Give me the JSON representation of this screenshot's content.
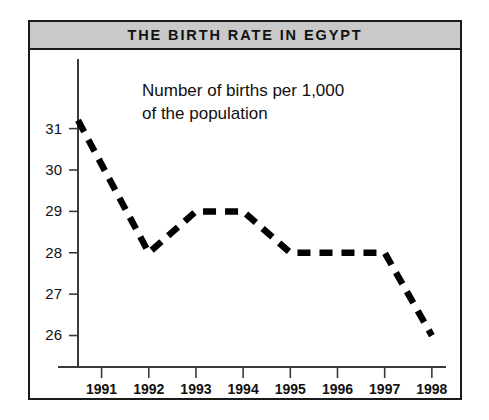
{
  "figure": {
    "title": "THE BIRTH RATE IN EGYPT",
    "annotation": "Number of births per 1,000\nof the population",
    "frame_color": "#1a1a1a",
    "banner_color": "#c9c9c9",
    "line_color": "#000000",
    "background_color": "#ffffff"
  },
  "chart_data": {
    "type": "line",
    "title": "THE BIRTH RATE IN EGYPT",
    "subtitle": "Number of births per 1,000 of the population",
    "xlabel": "",
    "ylabel": "",
    "x": [
      1990.5,
      1992,
      1993,
      1994,
      1995,
      1996,
      1997,
      1998
    ],
    "values": [
      31.2,
      28,
      29,
      29,
      28,
      28,
      28,
      26
    ],
    "categories": [
      "1991",
      "1992",
      "1993",
      "1994",
      "1995",
      "1996",
      "1997",
      "1998"
    ],
    "xtick_labels": [
      "1991",
      "1992",
      "1993",
      "1994",
      "1995",
      "1996",
      "1997",
      "1998"
    ],
    "ytick_labels": [
      "31",
      "30",
      "29",
      "28",
      "27",
      "26"
    ],
    "ytick_values": [
      31,
      30,
      29,
      28,
      27,
      26
    ],
    "xlim": [
      1990.5,
      1998.3
    ],
    "ylim": [
      25.65,
      31.45
    ],
    "grid": false,
    "legend": false,
    "line_style": "dashed",
    "line_width": 6.5,
    "annotations": [
      {
        "text": "Number of births per 1,000 of the population",
        "x": 1991.5,
        "y": 31
      }
    ]
  }
}
